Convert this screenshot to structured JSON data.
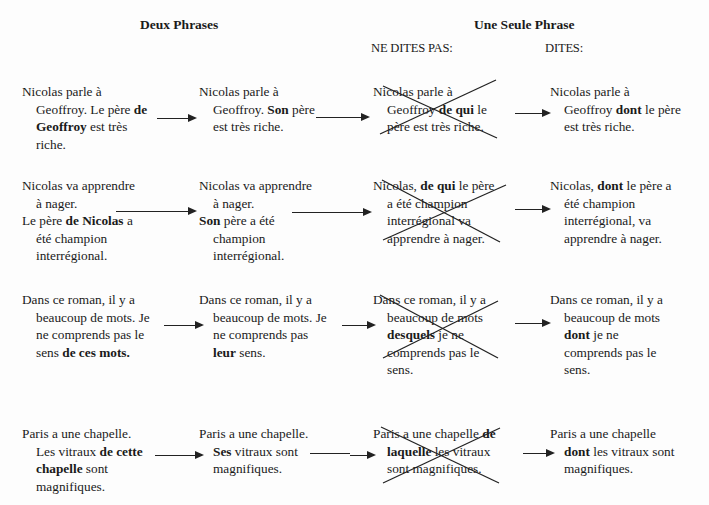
{
  "headers": {
    "left": "Deux Phrases",
    "right": "Une Seule Phrase",
    "wrong": "NE DITES PAS:",
    "right_sub": "DITES:"
  },
  "rows": [
    {
      "col1": [
        [
          {
            "t": "Nicolas parle à"
          }
        ],
        [
          {
            "t": "Geoffroy. Le père "
          },
          {
            "t": "de",
            "b": true
          }
        ],
        [
          {
            "t": "Geoffroy",
            "b": true
          },
          {
            "t": " est très"
          }
        ],
        [
          {
            "t": "riche."
          }
        ]
      ],
      "col2": [
        [
          {
            "t": "Nicolas parle à"
          }
        ],
        [
          {
            "t": "Geoffroy. "
          },
          {
            "t": "Son",
            "b": true
          },
          {
            "t": " père"
          }
        ],
        [
          {
            "t": "est très riche."
          }
        ]
      ],
      "col3": [
        [
          {
            "t": "Nicolas parle à"
          }
        ],
        [
          {
            "t": "Geoffroy "
          },
          {
            "t": "de qui",
            "b": true
          },
          {
            "t": " le"
          }
        ],
        [
          {
            "t": "père est très riche."
          }
        ]
      ],
      "col4": [
        [
          {
            "t": "Nicolas parle à"
          }
        ],
        [
          {
            "t": "Geoffroy "
          },
          {
            "t": "dont",
            "b": true
          },
          {
            "t": " le père"
          }
        ],
        [
          {
            "t": "est très riche."
          }
        ]
      ]
    },
    {
      "col1": [
        [
          {
            "t": "Nicolas va apprendre"
          }
        ],
        [
          {
            "t": "à nager."
          }
        ],
        [
          {
            "t": "Le père "
          },
          {
            "t": "de Nicolas",
            "b": true
          },
          {
            "t": " a"
          }
        ],
        [
          {
            "t": "été champion"
          }
        ],
        [
          {
            "t": "interrégional."
          }
        ]
      ],
      "col2": [
        [
          {
            "t": "Nicolas va apprendre"
          }
        ],
        [
          {
            "t": "à nager."
          }
        ],
        [
          {
            "t": "Son",
            "b": true
          },
          {
            "t": " père a été"
          }
        ],
        [
          {
            "t": "champion"
          }
        ],
        [
          {
            "t": "interrégional."
          }
        ]
      ],
      "col3": [
        [
          {
            "t": "Nicolas, "
          },
          {
            "t": "de qui",
            "b": true
          },
          {
            "t": " le père"
          }
        ],
        [
          {
            "t": "a été champion"
          }
        ],
        [
          {
            "t": "interrégional va"
          }
        ],
        [
          {
            "t": "apprendre à nager."
          }
        ]
      ],
      "col4": [
        [
          {
            "t": "Nicolas, "
          },
          {
            "t": "dont",
            "b": true
          },
          {
            "t": " le père a"
          }
        ],
        [
          {
            "t": "été champion"
          }
        ],
        [
          {
            "t": "interrégional, va"
          }
        ],
        [
          {
            "t": "apprendre à nager."
          }
        ]
      ]
    },
    {
      "col1": [
        [
          {
            "t": "Dans ce roman, il y a"
          }
        ],
        [
          {
            "t": "beaucoup de mots. Je"
          }
        ],
        [
          {
            "t": "ne comprends pas le"
          }
        ],
        [
          {
            "t": "sens "
          },
          {
            "t": "de ces mots.",
            "b": true
          }
        ]
      ],
      "col2": [
        [
          {
            "t": "Dans ce roman, il y a"
          }
        ],
        [
          {
            "t": "beaucoup de mots. Je"
          }
        ],
        [
          {
            "t": "ne comprends pas"
          }
        ],
        [
          {
            "t": "leur",
            "b": true
          },
          {
            "t": " sens."
          }
        ]
      ],
      "col3": [
        [
          {
            "t": "Dans ce roman, il y a"
          }
        ],
        [
          {
            "t": "beaucoup de mots"
          }
        ],
        [
          {
            "t": "desquels",
            "b": true
          },
          {
            "t": " je ne"
          }
        ],
        [
          {
            "t": "comprends pas le"
          }
        ],
        [
          {
            "t": "sens."
          }
        ]
      ],
      "col4": [
        [
          {
            "t": "Dans ce roman, il y a"
          }
        ],
        [
          {
            "t": "beaucoup de mots"
          }
        ],
        [
          {
            "t": "dont",
            "b": true
          },
          {
            "t": " je ne"
          }
        ],
        [
          {
            "t": "comprends pas le"
          }
        ],
        [
          {
            "t": "sens."
          }
        ]
      ]
    },
    {
      "col1": [
        [
          {
            "t": "Paris a une chapelle."
          }
        ],
        [
          {
            "t": "Les vitraux "
          },
          {
            "t": "de cette",
            "b": true
          }
        ],
        [
          {
            "t": "chapelle",
            "b": true
          },
          {
            "t": " sont"
          }
        ],
        [
          {
            "t": "magnifiques."
          }
        ]
      ],
      "col2": [
        [
          {
            "t": "Paris a une chapelle."
          }
        ],
        [
          {
            "t": "Ses",
            "b": true
          },
          {
            "t": " vitraux sont"
          }
        ],
        [
          {
            "t": "magnifiques."
          }
        ]
      ],
      "col3": [
        [
          {
            "t": "Paris a une chapelle "
          },
          {
            "t": "de",
            "b": true
          }
        ],
        [
          {
            "t": "laquelle",
            "b": true
          },
          {
            "t": " les vitraux"
          }
        ],
        [
          {
            "t": "sont magnifiques."
          }
        ]
      ],
      "col4": [
        [
          {
            "t": "Paris a une chapelle"
          }
        ],
        [
          {
            "t": "dont",
            "b": true
          },
          {
            "t": " les vitraux sont"
          }
        ],
        [
          {
            "t": "magnifiques."
          }
        ]
      ]
    }
  ]
}
